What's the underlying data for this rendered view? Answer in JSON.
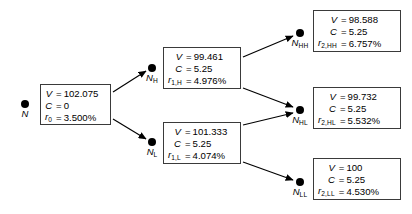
{
  "diagram": {
    "colors": {
      "ink": "#000000",
      "box_border": "#3a3a3a",
      "background": "#ffffff"
    },
    "labels": {
      "equals": "=",
      "percent_suffix": "%"
    },
    "nodes": [
      {
        "id": "N",
        "name": "N",
        "sub": "",
        "x": 25,
        "y": 104,
        "box": {
          "x": 40,
          "y": 84,
          "w": 71,
          "h": 41
        },
        "rows": [
          {
            "sym": "V",
            "sub": "",
            "eq": "=",
            "val": "102.075"
          },
          {
            "sym": "C",
            "sub": "",
            "eq": "=",
            "val": "0"
          },
          {
            "sym": "r",
            "sub": "0",
            "eq": "=",
            "val": "3.500%"
          }
        ]
      },
      {
        "id": "NH",
        "name": "N",
        "sub": "H",
        "x": 152,
        "y": 68,
        "box": {
          "x": 163,
          "y": 47,
          "w": 78,
          "h": 42
        },
        "rows": [
          {
            "sym": "V",
            "sub": "",
            "eq": "=",
            "val": "99.461"
          },
          {
            "sym": "C",
            "sub": "",
            "eq": "=",
            "val": "5.25"
          },
          {
            "sym": "r",
            "sub": "1,H",
            "eq": "=",
            "val": "4.976%"
          }
        ]
      },
      {
        "id": "NL",
        "name": "N",
        "sub": "L",
        "x": 152,
        "y": 142,
        "box": {
          "x": 163,
          "y": 122,
          "w": 78,
          "h": 42
        },
        "rows": [
          {
            "sym": "V",
            "sub": "",
            "eq": "=",
            "val": "101.333"
          },
          {
            "sym": "C",
            "sub": "",
            "eq": "=",
            "val": "5.25"
          },
          {
            "sym": "r",
            "sub": "1,L",
            "eq": "=",
            "val": "4.074%"
          }
        ]
      },
      {
        "id": "NHH",
        "name": "N",
        "sub": "HH",
        "x": 300,
        "y": 33,
        "box": {
          "x": 313,
          "y": 10,
          "w": 88,
          "h": 42
        },
        "rows": [
          {
            "sym": "V",
            "sub": "",
            "eq": "=",
            "val": "98.588"
          },
          {
            "sym": "C",
            "sub": "",
            "eq": "=",
            "val": "5.25"
          },
          {
            "sym": "r",
            "sub": "2,HH",
            "eq": "=",
            "val": "6.757%"
          }
        ]
      },
      {
        "id": "NHL",
        "name": "N",
        "sub": "HL",
        "x": 300,
        "y": 110,
        "box": {
          "x": 313,
          "y": 87,
          "w": 88,
          "h": 42
        },
        "rows": [
          {
            "sym": "V",
            "sub": "",
            "eq": "=",
            "val": "99.732"
          },
          {
            "sym": "C",
            "sub": "",
            "eq": "=",
            "val": "5.25"
          },
          {
            "sym": "r",
            "sub": "2,HL",
            "eq": "=",
            "val": "5.532%"
          }
        ]
      },
      {
        "id": "NLL",
        "name": "N",
        "sub": "LL",
        "x": 300,
        "y": 182,
        "box": {
          "x": 313,
          "y": 158,
          "w": 88,
          "h": 42
        },
        "rows": [
          {
            "sym": "V",
            "sub": "",
            "eq": "=",
            "val": "100"
          },
          {
            "sym": "C",
            "sub": "",
            "eq": "=",
            "val": "5.25"
          },
          {
            "sym": "r",
            "sub": "2,LL",
            "eq": "=",
            "val": "4.530%"
          }
        ]
      }
    ],
    "edges": [
      {
        "from": "N",
        "to": "NH",
        "x1": 113,
        "y1": 92,
        "x2": 146,
        "y2": 71
      },
      {
        "from": "N",
        "to": "NL",
        "x1": 113,
        "y1": 119,
        "x2": 146,
        "y2": 139
      },
      {
        "from": "NH",
        "to": "NHH",
        "x1": 243,
        "y1": 57,
        "x2": 293,
        "y2": 36
      },
      {
        "from": "NH",
        "to": "NHL",
        "x1": 243,
        "y1": 88,
        "x2": 293,
        "y2": 107
      },
      {
        "from": "NL",
        "to": "NHL",
        "x1": 243,
        "y1": 125,
        "x2": 293,
        "y2": 113
      },
      {
        "from": "NL",
        "to": "NLL",
        "x1": 243,
        "y1": 162,
        "x2": 293,
        "y2": 180
      }
    ]
  }
}
